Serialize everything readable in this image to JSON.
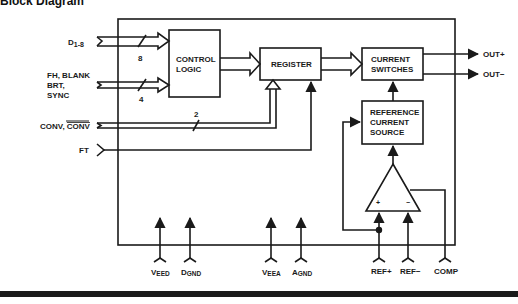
{
  "title": "Block Diagram",
  "blocks": {
    "control_logic": [
      "CONTROL",
      "LOGIC"
    ],
    "register": "REGISTER",
    "current_switches": [
      "CURRENT",
      "SWITCHES"
    ],
    "reference": [
      "REFERENCE",
      "CURRENT",
      "SOURCE"
    ]
  },
  "inputs": {
    "data": {
      "label": "D",
      "sub": "1-8",
      "width": "8"
    },
    "control": {
      "lines": [
        "FH, BLANK",
        "BRT,",
        "SYNC"
      ],
      "width": "4"
    },
    "conv": {
      "label": "CONV,",
      "label_bar": "CONV",
      "width": "2"
    },
    "ft": "FT"
  },
  "outputs": [
    "OUT+",
    "OUT−"
  ],
  "amplifier": {
    "plus": "+",
    "minus": "−"
  },
  "pins": [
    {
      "main": "V",
      "sub": "EED"
    },
    {
      "main": "D",
      "sub": "GND"
    },
    {
      "main": "V",
      "sub": "EEA"
    },
    {
      "main": "A",
      "sub": "GND"
    },
    {
      "main": "REF+",
      "sub": ""
    },
    {
      "main": "REF−",
      "sub": ""
    },
    {
      "main": "COMP",
      "sub": ""
    }
  ],
  "colors": {
    "ink": "#1a1a1a",
    "paper": "#ffffff"
  }
}
